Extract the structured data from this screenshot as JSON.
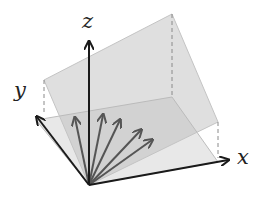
{
  "diagram": {
    "axes": {
      "x": {
        "label": "x"
      },
      "y": {
        "label": "y"
      },
      "z": {
        "label": "z"
      }
    },
    "colors": {
      "axis": "#1a1a1a",
      "vector": "#555555",
      "tilted_plane": "#d8d8d8",
      "floor_plane": "#e6e6e6",
      "plane_edge": "#bdbdbd",
      "dashed": "#8a8a8a"
    },
    "geometry": {
      "origin": [
        89,
        185
      ],
      "x_axis_tip": [
        229,
        160
      ],
      "y_axis_tip": [
        36,
        116
      ],
      "z_axis_tip": [
        89,
        41
      ],
      "tilted_plane": [
        [
          44,
          80
        ],
        [
          172,
          14
        ],
        [
          218,
          122
        ],
        [
          89,
          185
        ]
      ],
      "floor_plane": [
        [
          36,
          120
        ],
        [
          172,
          97
        ],
        [
          218,
          162
        ],
        [
          89,
          185
        ]
      ],
      "dashed_lines": [
        [
          [
            44,
            80
          ],
          [
            44,
            114
          ]
        ],
        [
          [
            172,
            14
          ],
          [
            172,
            97
          ]
        ],
        [
          [
            218,
            122
          ],
          [
            218,
            158
          ]
        ]
      ],
      "vector_tips": [
        [
          75,
          118
        ],
        [
          103,
          115
        ],
        [
          120,
          120
        ],
        [
          141,
          130
        ],
        [
          152,
          140
        ]
      ]
    }
  }
}
